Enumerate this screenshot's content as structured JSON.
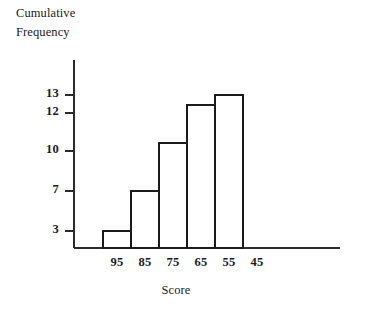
{
  "chart_data": {
    "type": "bar",
    "title": "",
    "xlabel": "Score",
    "ylabel": "Cumulative Frequency",
    "ylabel_lines": [
      "Cumulative",
      "Frequency"
    ],
    "categories": [
      "95-85",
      "85-75",
      "75-65",
      "65-55",
      "55-45"
    ],
    "x_tick_labels": [
      "95",
      "85",
      "75",
      "65",
      "55",
      "45"
    ],
    "x_tick_values": [
      95,
      85,
      75,
      65,
      55,
      45
    ],
    "y_tick_labels": [
      "13",
      "12",
      "10",
      "7",
      "3"
    ],
    "y_tick_values": [
      13,
      12,
      10,
      7,
      3
    ],
    "values": [
      3,
      7,
      10.5,
      12.5,
      13
    ],
    "bar_labels": [
      "3",
      "7",
      "10.5",
      "12.5",
      "13"
    ],
    "ylim": [
      0,
      14.5
    ],
    "grid": false,
    "legend": false,
    "bar_fill": "#ffffff",
    "bar_stroke": "#1a1a1a",
    "axis_color": "#2b2b2b",
    "series": [
      {
        "name": "Cumulative Frequency",
        "values": [
          3,
          7,
          10.5,
          12.5,
          13
        ]
      }
    ]
  },
  "geometry": {
    "axis_x": 74,
    "baseline_y": 248,
    "y_axis_top": 60,
    "x_axis_right": 340,
    "bar_left": 103,
    "bar_width": 28,
    "tick_pixels_y": {
      "13": 95,
      "12": 113,
      "10": 151,
      "7": 191,
      "3": 231
    },
    "bar_tops_px": [
      231,
      191,
      143,
      105,
      95
    ],
    "bar_edges_px": [
      103,
      131,
      159,
      187,
      215,
      243
    ],
    "tick_len": 9
  }
}
